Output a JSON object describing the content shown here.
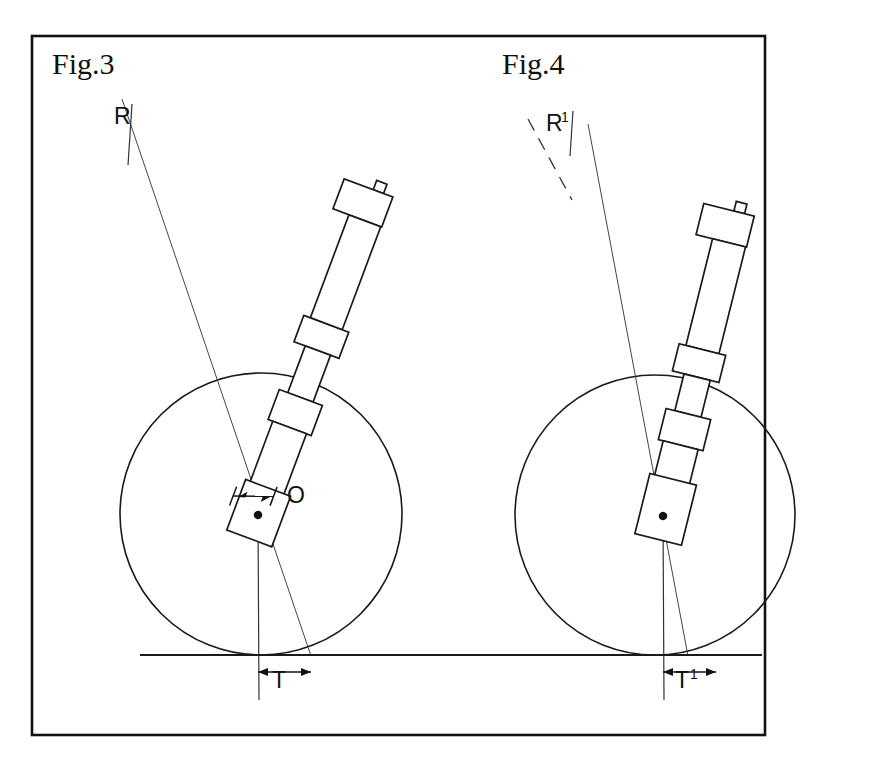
{
  "plate": {
    "border_color": "#111111",
    "background": "#ffffff",
    "line_color": "#1a1a1a"
  },
  "figures": [
    {
      "id": "fig3",
      "label": "Fig.3",
      "label_x": 52,
      "label_y": 74,
      "angle_label": "R",
      "angle_label_sup": "",
      "angle_label_x": 114,
      "angle_label_y": 124,
      "axis_style": "solid",
      "trail_label": "T",
      "trail_label_sup": "",
      "trail_label_x": 272,
      "trail_label_y": 688,
      "center_label": "O",
      "center_label_x": 287,
      "center_label_y": 503,
      "wheel": {
        "cx": 261,
        "cy": 514,
        "r": 141
      },
      "hub": {
        "x": 258,
        "y": 515
      },
      "strut_angle_deg": 20.5,
      "has_offset_dimension": true
    },
    {
      "id": "fig4",
      "label": "Fig.4",
      "label_x": 502,
      "label_y": 74,
      "angle_label": "R",
      "angle_label_sup": "1",
      "angle_label_x": 546,
      "angle_label_y": 131,
      "axis_style": "dashed",
      "trail_label": "T",
      "trail_label_sup": "1",
      "trail_label_x": 675,
      "trail_label_y": 688,
      "center_label": "",
      "center_label_x": 0,
      "center_label_y": 0,
      "wheel": {
        "cx": 655,
        "cy": 515,
        "r": 140
      },
      "hub": {
        "x": 664,
        "y": 516
      },
      "strut_angle_deg": 14.0,
      "has_offset_dimension": false
    }
  ],
  "ground_line": {
    "name": "ground-line",
    "x1": 140,
    "x2": 762,
    "y": 655
  },
  "border": {
    "x": 32,
    "y": 36,
    "width": 733,
    "height": 699
  }
}
